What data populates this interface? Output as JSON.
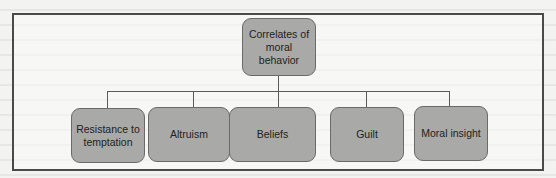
{
  "diagram": {
    "type": "tree",
    "root": {
      "label": "Correlates of\nmoral\nbehavior"
    },
    "children": [
      {
        "label": "Resistance to\ntemptation"
      },
      {
        "label": "Altruism"
      },
      {
        "label": "Beliefs"
      },
      {
        "label": "Guilt"
      },
      {
        "label": "Moral insight"
      }
    ],
    "colors": {
      "node_fill": "#a9a9a7",
      "node_border": "#6a6a6a",
      "frame_border": "#4a4a4a",
      "connector": "#5a5a5a",
      "background": "#f3f3f1"
    }
  }
}
